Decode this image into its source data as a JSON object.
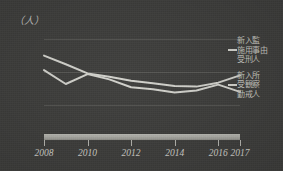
{
  "unit_label": "（人）",
  "axis": {
    "y_ticks": [
      "15,000",
      "10,000",
      "5,000",
      "0"
    ],
    "y_values": [
      15000,
      10000,
      5000,
      0
    ],
    "x_ticks": [
      "2008",
      "2010",
      "2012",
      "2014",
      "2016",
      "2017"
    ]
  },
  "legend": {
    "items": [
      {
        "name": "series-shinnyukan",
        "lines": [
          "新入監",
          "施用事由",
          "受刑人"
        ]
      },
      {
        "name": "series-shinnyusho",
        "lines": [
          "新入所",
          "受観察",
          "勤戒人"
        ]
      }
    ]
  },
  "colors": {
    "background": "#3a3a38",
    "line": "#d3d3cd",
    "text": "#cfcfc9",
    "grid": "#6a6a65",
    "axis_bar": "#b0b0aa"
  },
  "chart_data": {
    "type": "line",
    "title": "",
    "xlabel": "",
    "ylabel": "（人）",
    "grid": true,
    "legend_position": "right",
    "ylim": [
      0,
      17000
    ],
    "xlim": [
      2008,
      2017
    ],
    "x": [
      2008,
      2009,
      2010,
      2011,
      2012,
      2013,
      2014,
      2015,
      2016,
      2017
    ],
    "categories": [
      "2008",
      "2009",
      "2010",
      "2011",
      "2012",
      "2013",
      "2014",
      "2015",
      "2016",
      "2017"
    ],
    "series": [
      {
        "name": "新入監 施用事由 受刑人",
        "values": [
          12500,
          11200,
          9800,
          9300,
          8700,
          8300,
          7900,
          7800,
          8400,
          9500
        ]
      },
      {
        "name": "新入所 受観察 勤戒人",
        "values": [
          10300,
          8200,
          9700,
          8900,
          7700,
          7400,
          6900,
          7200,
          8100,
          7000
        ]
      }
    ]
  }
}
